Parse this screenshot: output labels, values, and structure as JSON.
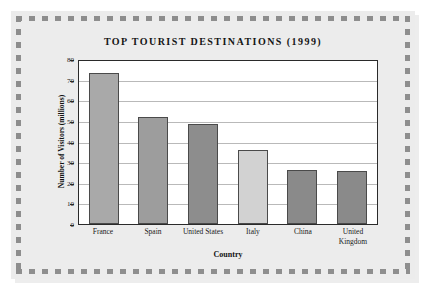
{
  "chart_data": {
    "type": "bar",
    "title": "TOP TOURIST DESTINATIONS (1999)",
    "xlabel": "Country",
    "ylabel": "Number of Visitors (millions)",
    "categories": [
      "France",
      "Spain",
      "United States",
      "Italy",
      "China",
      "United Kingdom"
    ],
    "values": [
      73.0,
      51.7,
      48.5,
      36.0,
      26.1,
      25.5
    ],
    "bar_colors": [
      "#a9a9a9",
      "#9d9d9d",
      "#8d8d8d",
      "#d2d2d2",
      "#8a8a8a",
      "#8a8a8a"
    ],
    "ylim": [
      0,
      80
    ],
    "yticks": [
      80,
      70,
      60,
      50,
      40,
      30,
      20,
      10,
      0
    ],
    "grid": true,
    "legend": "none"
  },
  "frame": {
    "style": "dashed-square-border",
    "dash_color": "#8e8e8e",
    "panel_color": "#ececec",
    "plot_bg": "#ffffff"
  }
}
